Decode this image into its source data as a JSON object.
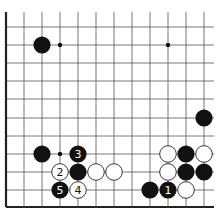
{
  "diagram": {
    "type": "go-board-fragment",
    "grid": {
      "columns": 12,
      "rows": 11,
      "x_lines": [
        6,
        24,
        42,
        60,
        78,
        96,
        114,
        132,
        150,
        168,
        186,
        204
      ],
      "y_lines": [
        27,
        45,
        63,
        81,
        99,
        118,
        136,
        154,
        172,
        190,
        207
      ],
      "left_edge": true,
      "bottom_edge": true,
      "top_open": true,
      "right_open": true
    },
    "colors": {
      "line": "#555555",
      "edge": "#222222",
      "black_stone": "#111111",
      "white_stone": "#ffffff"
    },
    "hoshi": [
      {
        "col": 3,
        "row": 1
      },
      {
        "col": 9,
        "row": 1
      },
      {
        "col": 3,
        "row": 7
      }
    ],
    "stones": [
      {
        "col": 2,
        "row": 1,
        "color": "black",
        "label": ""
      },
      {
        "col": 11,
        "row": 5,
        "color": "black",
        "label": ""
      },
      {
        "col": 2,
        "row": 7,
        "color": "black",
        "label": ""
      },
      {
        "col": 4,
        "row": 7,
        "color": "black",
        "label": "3"
      },
      {
        "col": 3,
        "row": 8,
        "color": "white",
        "label": "2"
      },
      {
        "col": 4,
        "row": 8,
        "color": "black",
        "label": ""
      },
      {
        "col": 5,
        "row": 8,
        "color": "white",
        "label": ""
      },
      {
        "col": 6,
        "row": 8,
        "color": "white",
        "label": ""
      },
      {
        "col": 3,
        "row": 9,
        "color": "black",
        "label": "5"
      },
      {
        "col": 4,
        "row": 9,
        "color": "white",
        "label": "4"
      },
      {
        "col": 9,
        "row": 7,
        "color": "white",
        "label": ""
      },
      {
        "col": 10,
        "row": 7,
        "color": "black",
        "label": ""
      },
      {
        "col": 11,
        "row": 7,
        "color": "white",
        "label": ""
      },
      {
        "col": 9,
        "row": 8,
        "color": "white",
        "label": ""
      },
      {
        "col": 10,
        "row": 8,
        "color": "black",
        "label": ""
      },
      {
        "col": 11,
        "row": 8,
        "color": "black",
        "label": ""
      },
      {
        "col": 8,
        "row": 9,
        "color": "black",
        "label": ""
      },
      {
        "col": 9,
        "row": 9,
        "color": "black",
        "label": "1"
      },
      {
        "col": 10,
        "row": 9,
        "color": "white",
        "label": ""
      }
    ]
  }
}
